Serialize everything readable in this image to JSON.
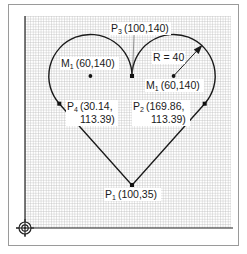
{
  "diagram": {
    "units_scale_px_per_unit": 1.04,
    "origin_px": {
      "x": 132,
      "y": 76,
      "ref": [
        100,
        140
      ]
    },
    "colors": {
      "grid": "#b8b8b8",
      "line": "#1a1a1a",
      "frame": "#9a9a9a",
      "label_bg": "#ffffff"
    },
    "points": [
      {
        "id": "P1",
        "name": "P",
        "sub": "1",
        "coords": "(100,35)",
        "x": 100,
        "y": 35
      },
      {
        "id": "P2",
        "name": "P",
        "sub": "2",
        "coords_line1": "(169.86,",
        "coords_line2": "113.39)",
        "x": 169.86,
        "y": 113.39
      },
      {
        "id": "P3",
        "name": "P",
        "sub": "3",
        "coords": "(100,140)",
        "x": 100,
        "y": 140
      },
      {
        "id": "P4",
        "name": "P",
        "sub": "4",
        "coords_line1": "(30.14,",
        "coords_line2": "113.39)",
        "x": 30.14,
        "y": 113.39
      }
    ],
    "centers": [
      {
        "id": "M1_left",
        "name": "M",
        "sub": "1",
        "coords": "(60,140)",
        "x": 60,
        "y": 140
      },
      {
        "id": "M1_right",
        "name": "M",
        "sub": "1",
        "coords": "(60,140)",
        "x": 140,
        "y": 140
      }
    ],
    "radius_label": "R = 40",
    "radius": 40
  }
}
